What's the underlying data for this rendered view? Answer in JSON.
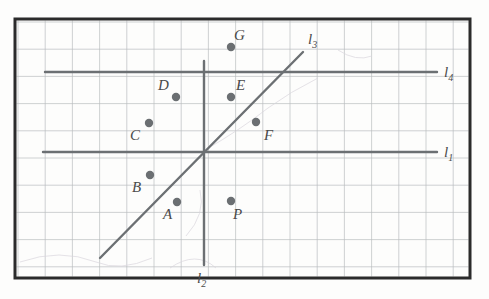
{
  "figure": {
    "background_color": "#fdfdfc",
    "frame": {
      "color": "#2b2b2b",
      "x": 15,
      "y": 19,
      "width": 455,
      "height": 259
    },
    "grid": {
      "color": "#b9bcbe",
      "cell_size": 27.2,
      "origin_x": 18,
      "origin_y": 22,
      "visible": true
    },
    "line_color": "#6c7073",
    "point_color": "#6b6f72",
    "point_radius": 4.2
  },
  "lines": [
    {
      "id": "l1",
      "label": "l",
      "subscript": "1",
      "kind": "horizontal",
      "x1": 43,
      "y1": 152,
      "x2": 437,
      "y2": 152,
      "label_x": 444,
      "label_y": 157
    },
    {
      "id": "l2",
      "label": "l",
      "subscript": "2",
      "kind": "vertical",
      "x1": 204,
      "y1": 61,
      "x2": 204,
      "y2": 265,
      "label_x": 197,
      "label_y": 283
    },
    {
      "id": "l3",
      "label": "l",
      "subscript": "3",
      "kind": "diagonal",
      "x1": 100,
      "y1": 258,
      "x2": 303,
      "y2": 52,
      "label_x": 308,
      "label_y": 44
    },
    {
      "id": "l4",
      "label": "l",
      "subscript": "4",
      "kind": "horizontal",
      "x1": 45,
      "y1": 72,
      "x2": 437,
      "y2": 72,
      "label_x": 444,
      "label_y": 77
    }
  ],
  "points": [
    {
      "id": "A",
      "label": "A",
      "x": 177,
      "y": 202,
      "label_x": 163,
      "label_y": 219
    },
    {
      "id": "B",
      "label": "B",
      "x": 150,
      "y": 175,
      "label_x": 132,
      "label_y": 192
    },
    {
      "id": "C",
      "label": "C",
      "x": 149,
      "y": 123,
      "label_x": 130,
      "label_y": 140
    },
    {
      "id": "D",
      "label": "D",
      "x": 176,
      "y": 97,
      "label_x": 158,
      "label_y": 90
    },
    {
      "id": "E",
      "label": "E",
      "x": 231,
      "y": 97,
      "label_x": 236,
      "label_y": 90
    },
    {
      "id": "F",
      "label": "F",
      "x": 256,
      "y": 122,
      "label_x": 264,
      "label_y": 140
    },
    {
      "id": "G",
      "label": "G",
      "x": 231,
      "y": 47,
      "label_x": 234,
      "label_y": 40
    },
    {
      "id": "P",
      "label": "P",
      "x": 231,
      "y": 201,
      "label_x": 233,
      "label_y": 219
    }
  ]
}
